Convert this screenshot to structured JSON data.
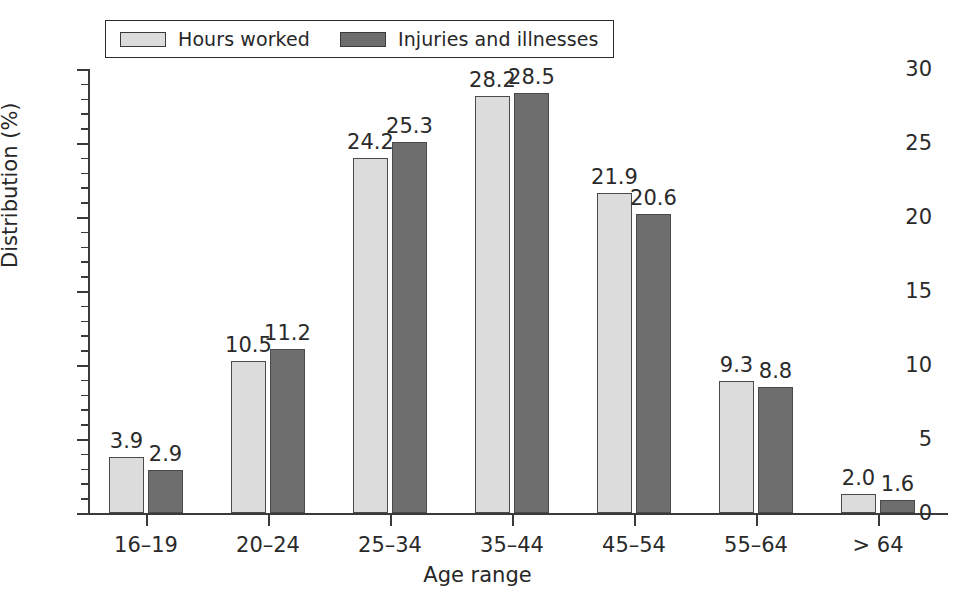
{
  "chart_data": {
    "type": "bar",
    "title": "",
    "xlabel": "Age range",
    "ylabel": "Distribution (%)",
    "categories": [
      "16–19",
      "20–24",
      "25–34",
      "35–44",
      "45–54",
      "55–64",
      "> 64"
    ],
    "series": [
      {
        "name": "Hours worked",
        "color": "#dcdcdc",
        "values": [
          3.9,
          10.5,
          24.2,
          28.2,
          21.9,
          9.3,
          2.0
        ],
        "drawn_heights": [
          3.8,
          10.3,
          24.0,
          28.2,
          21.6,
          8.9,
          1.3
        ]
      },
      {
        "name": "Injuries and illnesses",
        "color": "#6e6e6e",
        "values": [
          2.9,
          11.2,
          25.3,
          28.5,
          20.6,
          8.8,
          1.6
        ],
        "drawn_heights": [
          2.9,
          11.1,
          25.1,
          28.4,
          20.2,
          8.5,
          0.9
        ]
      }
    ],
    "ylim": [
      0,
      30
    ],
    "yticks": [
      0,
      5,
      10,
      15,
      20,
      25,
      30
    ],
    "ytick_labels": [
      "0",
      "5",
      "10",
      "15",
      "20",
      "25",
      "30"
    ],
    "yminor_step": 1,
    "grid": false,
    "legend_position": "top-left"
  },
  "legend": {
    "entries": [
      {
        "label": "Hours worked",
        "swatch": "light-gray-swatch"
      },
      {
        "label": "Injuries and illnesses",
        "swatch": "dark-gray-swatch"
      }
    ]
  }
}
